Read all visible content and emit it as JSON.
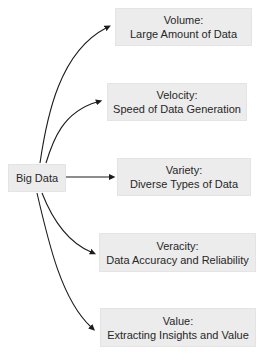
{
  "diagram": {
    "title_concept": "Big Data 5 Vs",
    "root": {
      "label": "Big Data"
    },
    "nodes": [
      {
        "id": "volume",
        "title": "Volume:",
        "desc": "Large Amount of Data"
      },
      {
        "id": "velocity",
        "title": "Velocity:",
        "desc": "Speed of Data Generation"
      },
      {
        "id": "variety",
        "title": "Variety:",
        "desc": "Diverse Types of Data"
      },
      {
        "id": "veracity",
        "title": "Veracity:",
        "desc": "Data Accuracy and Reliability"
      },
      {
        "id": "value",
        "title": "Value:",
        "desc": "Extracting Insights and Value"
      }
    ],
    "edges": [
      {
        "from": "Big Data",
        "to": "Volume"
      },
      {
        "from": "Big Data",
        "to": "Velocity"
      },
      {
        "from": "Big Data",
        "to": "Variety"
      },
      {
        "from": "Big Data",
        "to": "Veracity"
      },
      {
        "from": "Big Data",
        "to": "Value"
      }
    ],
    "colors": {
      "canvas_bg": "#ffffff",
      "box_bg": "#ececec",
      "box_border": "#e4e4e4",
      "text": "#272727",
      "arrow": "#1c1c1c"
    }
  }
}
